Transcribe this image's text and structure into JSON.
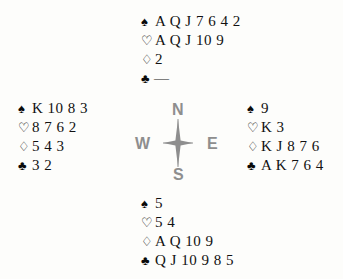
{
  "board": {
    "background_color": "#fdfdfb",
    "text_color": "#111111",
    "compass_color": "#8e8e8e"
  },
  "suits": {
    "spade": "♠",
    "heart": "♡",
    "diamond": "♢",
    "club": "♣",
    "void": "—"
  },
  "compass": {
    "north_label": "N",
    "west_label": "W",
    "east_label": "E",
    "south_label": "S",
    "star_icon": "compass-star-icon"
  },
  "hands": {
    "north": {
      "seat": "North",
      "spades": "A Q J 7 6 4 2",
      "hearts": "A Q J 10 9",
      "diamonds": "2",
      "clubs": "—"
    },
    "west": {
      "seat": "West",
      "spades": "K 10 8 3",
      "hearts": "8 7 6 2",
      "diamonds": "5 4 3",
      "clubs": "3 2"
    },
    "east": {
      "seat": "East",
      "spades": "9",
      "hearts": "K 3",
      "diamonds": "K J 8 7 6",
      "clubs": "A K 7 6 4"
    },
    "south": {
      "seat": "South",
      "spades": "5",
      "hearts": "5 4",
      "diamonds": "A Q 10 9",
      "clubs": "Q J 10 9 8 5"
    }
  }
}
